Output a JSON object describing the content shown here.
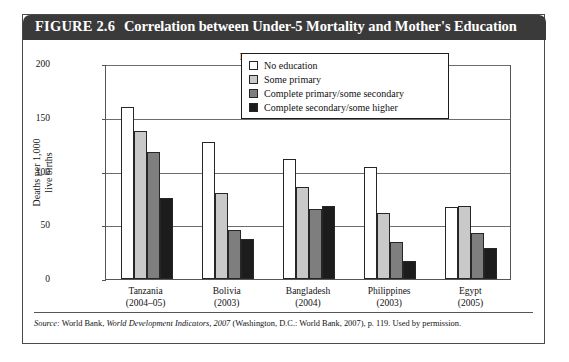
{
  "figure": {
    "number": "FIGURE 2.6",
    "title": "Correlation between Under-5 Mortality and Mother's Education"
  },
  "source": {
    "prefix": "Source:",
    "body_1": " World Bank, ",
    "italic": "World Development Indicators, 2007",
    "body_2": " (Washington, D.C.: World Bank, 2007), p. 119. Used by permission."
  },
  "colors": {
    "header_bg": "#3a3a3a",
    "series_0": "#ffffff",
    "series_1": "#c9c9c9",
    "series_2": "#7e7e7e",
    "series_3": "#1c1c1c"
  },
  "chart_data": {
    "type": "bar",
    "title": "Mother's Education",
    "xlabel": "",
    "ylabel": "Deaths per 1,000\nlive births",
    "ylim": [
      0,
      200
    ],
    "yticks": [
      0,
      50,
      100,
      150,
      200
    ],
    "ytick_labels": [
      "0",
      "50",
      "100",
      "150",
      "200"
    ],
    "grid": true,
    "legend_position": "upper right inside plot",
    "categories": [
      "Tanzania\n(2004–05)",
      "Bolivia\n(2003)",
      "Bangladesh\n(2004)",
      "Philippines\n(2003)",
      "Egypt\n(2005)"
    ],
    "category_names": [
      "Tanzania",
      "Bolivia",
      "Bangladesh",
      "Philippines",
      "Egypt"
    ],
    "category_years": [
      "(2004–05)",
      "(2003)",
      "(2004)",
      "(2003)",
      "(2005)"
    ],
    "series": [
      {
        "name": "No education",
        "values": [
          160,
          127,
          112,
          104,
          67
        ]
      },
      {
        "name": "Some primary",
        "values": [
          138,
          80,
          86,
          61,
          68
        ]
      },
      {
        "name": "Complete primary/some secondary",
        "values": [
          118,
          46,
          65,
          34,
          43
        ]
      },
      {
        "name": "Complete secondary/some higher",
        "values": [
          75,
          37,
          68,
          17,
          29
        ]
      }
    ]
  }
}
